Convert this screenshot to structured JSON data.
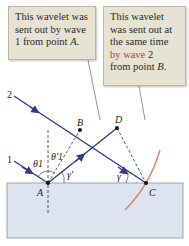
{
  "callouts": {
    "a": {
      "line1": "This wavelet was",
      "line2": "sent out by wave",
      "line3": "1 from point ",
      "point": "A",
      "end": "."
    },
    "b": {
      "line1": "This wavelet",
      "line2": "was sent out at",
      "line3": "the same time",
      "line4_red": "by wave",
      "line4_rest": " 2",
      "line5": "from point ",
      "point": "B",
      "end": "."
    }
  },
  "labels": {
    "ray1": "1",
    "ray2": "2",
    "point_a": "A",
    "point_b": "B",
    "point_c": "C",
    "point_d": "D",
    "theta1": "θ1",
    "theta1_prime": "θ'1",
    "gamma": "γ",
    "gamma_prime": "γ'"
  },
  "colors": {
    "ray": "#2e3a8c",
    "wavefront_arc": "#d9826a",
    "glass_fill": "#dde3ef",
    "glass_border": "#9aa3b5",
    "callout_bg": "#e6e3d3",
    "accent_red": "#c0392b"
  }
}
